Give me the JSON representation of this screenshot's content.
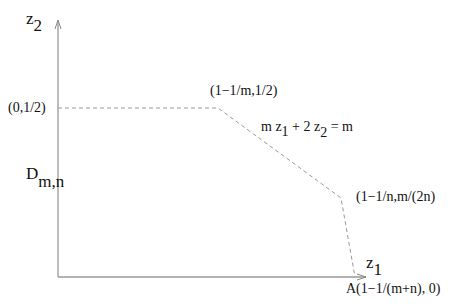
{
  "diagram": {
    "axes": {
      "x_label": "z",
      "x_label_sub": "1",
      "y_label": "z",
      "y_label_sub": "2"
    },
    "region_label": "D",
    "region_label_sub": "m,n",
    "points": [
      {
        "id": "p0",
        "label": "(0,1/2)"
      },
      {
        "id": "p1",
        "label": "(1−1/m,1/2)"
      },
      {
        "id": "p2",
        "label": "(1−1/n,m/(2n)"
      },
      {
        "id": "p3",
        "label": "A(1−1/(m+n), 0)"
      }
    ],
    "equation": {
      "part1": "m z",
      "sub1": "1",
      "part2": " + 2 z",
      "sub2": "2",
      "part3": " = m"
    },
    "colors": {
      "axis": "#888888",
      "dashed": "#888888",
      "text": "#111111"
    }
  }
}
